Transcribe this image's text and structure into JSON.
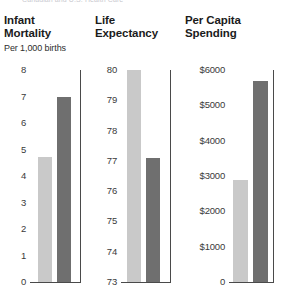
{
  "clipped_caption": "Canadian and U.S. Health Care",
  "colors": {
    "light_bar": "#c9c9c9",
    "dark_bar": "#6f6f6f",
    "axis": "#4a4a4a",
    "text": "#1b1b1b"
  },
  "chart_data": [
    {
      "type": "bar",
      "title": "Infant Mortality",
      "title_line1": "Infant",
      "title_line2": "Mortality",
      "subtitle": "Per 1,000 births",
      "xlabel": "",
      "ylabel": "",
      "ylim": [
        0,
        8
      ],
      "grid": false,
      "legend": "none",
      "ticks": [
        "8",
        "7",
        "6",
        "5",
        "4",
        "3",
        "2",
        "1",
        "0"
      ],
      "tick_values": [
        8,
        7,
        6,
        5,
        4,
        3,
        2,
        1,
        0
      ],
      "categories": [
        "Canada",
        "United States"
      ],
      "series": [
        {
          "name": "Canada",
          "color": "#c9c9c9",
          "values": [
            4.7
          ]
        },
        {
          "name": "United States",
          "color": "#6f6f6f",
          "values": [
            7.0
          ]
        }
      ],
      "values": [
        4.7,
        7.0
      ]
    },
    {
      "type": "bar",
      "title": "Life Expectancy",
      "title_line1": "Life",
      "title_line2": "Expectancy",
      "subtitle": "",
      "xlabel": "",
      "ylabel": "",
      "ylim": [
        73,
        80
      ],
      "grid": false,
      "legend": "none",
      "ticks": [
        "80",
        "79",
        "78",
        "77",
        "76",
        "75",
        "74",
        "73"
      ],
      "tick_values": [
        80,
        79,
        78,
        77,
        76,
        75,
        74,
        73
      ],
      "categories": [
        "Canada",
        "United States"
      ],
      "series": [
        {
          "name": "Canada",
          "color": "#c9c9c9",
          "values": [
            80.0
          ]
        },
        {
          "name": "United States",
          "color": "#6f6f6f",
          "values": [
            77.1
          ]
        }
      ],
      "values": [
        80.0,
        77.1
      ]
    },
    {
      "type": "bar",
      "title": "Per Capita Spending",
      "title_line1": "Per Capita",
      "title_line2": "Spending",
      "subtitle": "",
      "xlabel": "",
      "ylabel": "",
      "ylim": [
        0,
        6000
      ],
      "grid": false,
      "legend": "none",
      "ticks": [
        "$6000",
        "$5000",
        "$4000",
        "$3000",
        "$2000",
        "$1000",
        "0"
      ],
      "tick_values": [
        6000,
        5000,
        4000,
        3000,
        2000,
        1000,
        0
      ],
      "categories": [
        "Canada",
        "United States"
      ],
      "series": [
        {
          "name": "Canada",
          "color": "#c9c9c9",
          "values": [
            2900
          ]
        },
        {
          "name": "United States",
          "color": "#6f6f6f",
          "values": [
            5700
          ]
        }
      ],
      "values": [
        2900,
        5700
      ]
    }
  ]
}
